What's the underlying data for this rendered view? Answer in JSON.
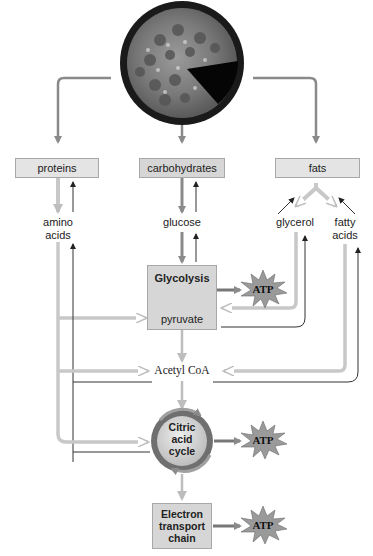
{
  "diagram": {
    "source_image": "pizza",
    "nutrients": [
      {
        "id": "proteins",
        "label": "proteins"
      },
      {
        "id": "carbohydrates",
        "label": "carbohydrates"
      },
      {
        "id": "fats",
        "label": "fats"
      }
    ],
    "monomers": {
      "amino_acids_line1": "amino",
      "amino_acids_line2": "acids",
      "glucose": "glucose",
      "glycerol": "glycerol",
      "fatty_acids_line1": "fatty",
      "fatty_acids_line2": "acids"
    },
    "glycolysis": {
      "title": "Glycolysis",
      "product": "pyruvate"
    },
    "acetyl_coa": "Acetyl CoA",
    "citric_acid_cycle": {
      "line1": "Citric",
      "line2": "acid",
      "line3": "cycle"
    },
    "electron_transport_chain": {
      "line1": "Electron",
      "line2": "transport",
      "line3": "chain"
    },
    "atp_outputs": [
      {
        "from": "glycolysis",
        "label": "ATP"
      },
      {
        "from": "citric_acid_cycle",
        "label": "ATP"
      },
      {
        "from": "electron_transport_chain",
        "label": "ATP"
      }
    ],
    "colors": {
      "catabolic_arrow": "#8a8a8a",
      "hollow_arrow": "#c8c8c8",
      "anabolic_arrow": "#333333",
      "box_fill": "#d6d6d6",
      "atp_burst": "#9a9a9a"
    }
  }
}
